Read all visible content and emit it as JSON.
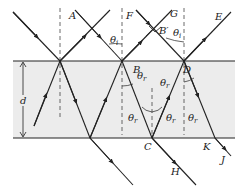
{
  "diagram": {
    "colors": {
      "film": "#ececec",
      "line": "#222222",
      "dash": "#444444"
    },
    "labels": {
      "A": "A",
      "F": "F",
      "G": "G",
      "E": "E",
      "B": "B",
      "Bprime": "B′",
      "D": "D",
      "C": "C",
      "K": "K",
      "J": "J",
      "H": "H",
      "d": "d",
      "theta": "θ",
      "theta_i_sub": "i",
      "theta_r_sub": "r"
    }
  }
}
